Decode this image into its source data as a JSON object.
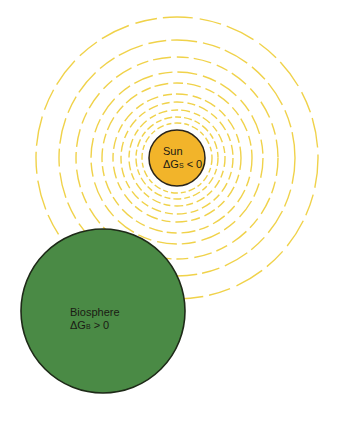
{
  "diagram": {
    "sun": {
      "name": "Sun",
      "equation_prefix": "ΔG",
      "equation_sub": "S",
      "equation_suffix": " < 0",
      "color": "#f2b42a"
    },
    "biosphere": {
      "name": "Biosphere",
      "equation_prefix": "ΔG",
      "equation_sub": "B",
      "equation_suffix": " > 0",
      "color": "#4a8a45"
    },
    "radiation_color": "#f0d24a"
  }
}
